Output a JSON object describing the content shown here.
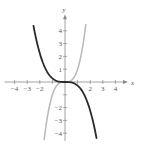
{
  "chart_data": {
    "type": "line",
    "title": "",
    "xlabel": "x",
    "ylabel": "y",
    "xlim": [
      -4.8,
      5.0
    ],
    "ylim": [
      -4.6,
      5.3
    ],
    "grid": false,
    "x_ticks": [
      -4,
      -3,
      -2,
      -1,
      1,
      2,
      3,
      4
    ],
    "y_ticks": [
      -4,
      -3,
      -2,
      -1,
      1,
      2,
      3,
      4
    ],
    "x_tick_labels": [
      {
        "value": -4,
        "label": "−4"
      },
      {
        "value": -3,
        "label": "−3"
      },
      {
        "value": -2,
        "label": "−2"
      },
      {
        "value": 2,
        "label": "2"
      },
      {
        "value": 3,
        "label": "3"
      },
      {
        "value": 4,
        "label": "4"
      }
    ],
    "y_tick_labels": [
      {
        "value": 4,
        "label": "4"
      },
      {
        "value": 3,
        "label": "3"
      },
      {
        "value": 2,
        "label": "2"
      },
      {
        "value": 1,
        "label": "1"
      },
      {
        "value": -2,
        "label": "−2"
      },
      {
        "value": -3,
        "label": "−3"
      },
      {
        "value": -4,
        "label": "−4"
      }
    ],
    "series": [
      {
        "name": "gray curve (y = x^3)",
        "color": "#b8b8b8",
        "x_range": [
          -1.65,
          1.65
        ],
        "coefficient": 1,
        "power": 3
      },
      {
        "name": "dark curve (y ≈ -0.28x^3)",
        "color": "#2a2a2a",
        "x_range": [
          -2.5,
          2.5
        ],
        "coefficient": -0.28,
        "power": 3
      }
    ]
  }
}
